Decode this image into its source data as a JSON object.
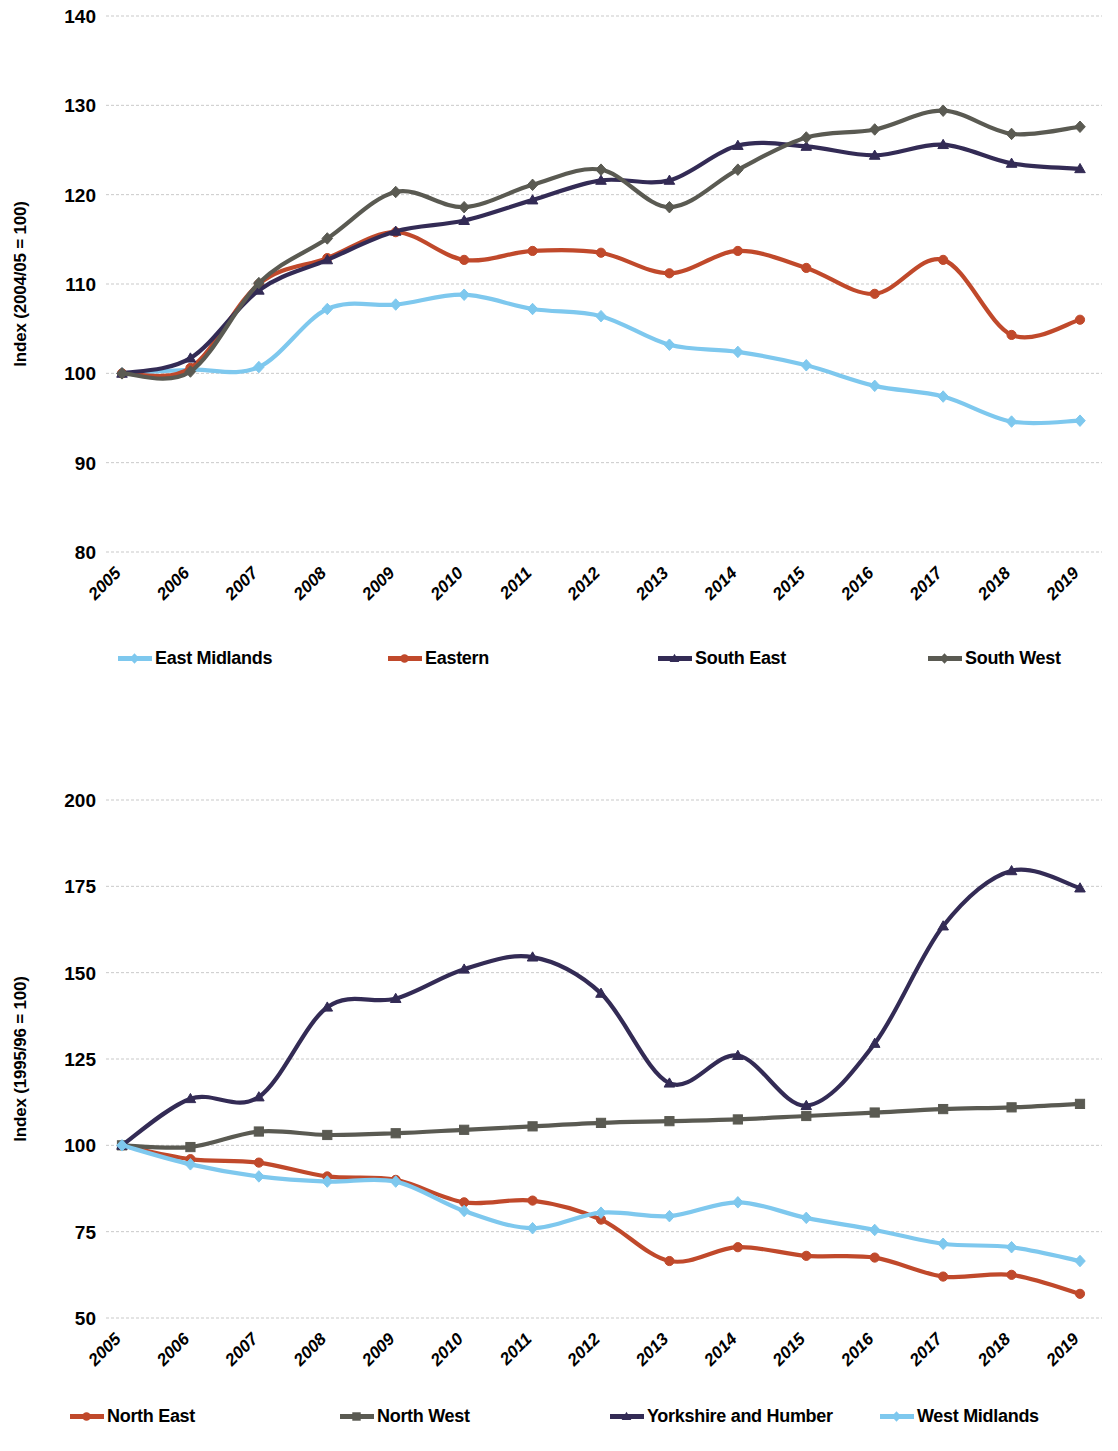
{
  "chart_data": [
    {
      "type": "line",
      "title": "",
      "xlabel": "",
      "ylabel": "Index (2004/05 = 100)",
      "categories": [
        "2005",
        "2006",
        "2007",
        "2008",
        "2009",
        "2010",
        "2011",
        "2012",
        "2013",
        "2014",
        "2015",
        "2016",
        "2017",
        "2018",
        "2019"
      ],
      "ylim": [
        80,
        140
      ],
      "yticks": [
        80,
        90,
        100,
        110,
        120,
        130,
        140
      ],
      "grid": true,
      "legend_position": "bottom",
      "series": [
        {
          "name": "East Midlands",
          "color": "#7EC8EE",
          "marker": "diamond",
          "values": [
            100.0,
            100.4,
            100.7,
            107.2,
            107.7,
            108.8,
            107.2,
            106.4,
            103.2,
            102.4,
            100.9,
            98.6,
            97.4,
            94.6,
            94.7
          ]
        },
        {
          "name": "Eastern",
          "color": "#C0492B",
          "marker": "circle",
          "values": [
            100.0,
            100.6,
            110.0,
            112.9,
            115.8,
            112.7,
            113.7,
            113.5,
            111.2,
            113.7,
            111.8,
            108.9,
            112.7,
            104.3,
            106.0
          ]
        },
        {
          "name": "South East",
          "color": "#332B55",
          "marker": "triangle",
          "values": [
            100.0,
            101.7,
            109.3,
            112.7,
            115.9,
            117.1,
            119.4,
            121.6,
            121.6,
            125.5,
            125.4,
            124.4,
            125.6,
            123.5,
            122.9
          ]
        },
        {
          "name": "South West",
          "color": "#5A5A52",
          "marker": "diamond",
          "values": [
            100.0,
            100.2,
            110.1,
            115.1,
            120.3,
            118.6,
            121.1,
            122.8,
            118.6,
            122.8,
            126.4,
            127.3,
            129.4,
            126.8,
            127.6
          ]
        }
      ]
    },
    {
      "type": "line",
      "title": "",
      "xlabel": "",
      "ylabel": "Index (1995/96 = 100)",
      "categories": [
        "2005",
        "2006",
        "2007",
        "2008",
        "2009",
        "2010",
        "2011",
        "2012",
        "2013",
        "2014",
        "2015",
        "2016",
        "2017",
        "2018",
        "2019"
      ],
      "ylim": [
        50,
        200
      ],
      "yticks": [
        50,
        75,
        100,
        125,
        150,
        175,
        200
      ],
      "grid": true,
      "legend_position": "bottom",
      "series": [
        {
          "name": "North East",
          "color": "#C0492B",
          "marker": "circle",
          "values": [
            100.0,
            96.0,
            95.0,
            91.0,
            90.0,
            83.5,
            84.0,
            78.5,
            66.5,
            70.5,
            68.0,
            67.5,
            62.0,
            62.5,
            57.0
          ]
        },
        {
          "name": "North West",
          "color": "#5A5A52",
          "marker": "square",
          "values": [
            100.0,
            99.5,
            104.0,
            103.0,
            103.5,
            104.5,
            105.5,
            106.5,
            107.0,
            107.5,
            108.5,
            109.5,
            110.5,
            111.0,
            112.0
          ]
        },
        {
          "name": "Yorkshire and Humber",
          "color": "#332B55",
          "marker": "triangle",
          "values": [
            100.0,
            113.5,
            114.0,
            140.0,
            142.5,
            151.0,
            154.5,
            144.0,
            118.0,
            126.0,
            111.5,
            129.5,
            163.5,
            179.5,
            174.5
          ]
        },
        {
          "name": "West Midlands",
          "color": "#7EC8EE",
          "marker": "diamond",
          "values": [
            100.0,
            94.5,
            91.0,
            89.5,
            89.5,
            81.0,
            76.0,
            80.5,
            79.5,
            83.5,
            79.0,
            75.5,
            71.5,
            70.5,
            66.5
          ]
        }
      ]
    }
  ]
}
